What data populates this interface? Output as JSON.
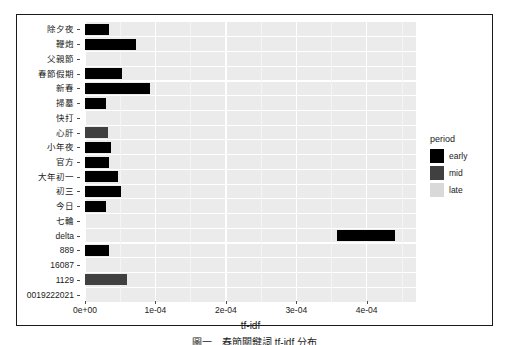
{
  "figure": {
    "caption": "圖一　春節關鍵詞 tf-idf 分布"
  },
  "axis": {
    "x_title": "tf-idf",
    "x_ticks": [
      "0e+00",
      "1e-04",
      "2e-04",
      "3e-04",
      "4e-04"
    ],
    "x_tick_values": [
      0,
      0.0001,
      0.0002,
      0.0003,
      0.0004
    ]
  },
  "legend": {
    "title": "period",
    "items": [
      {
        "label": "early",
        "color": "#000000"
      },
      {
        "label": "mid",
        "color": "#404040"
      },
      {
        "label": "late",
        "color": "#d9d9d9"
      }
    ]
  },
  "colors": {
    "panel_background": "#ebebeb",
    "gridline": "#ffffff",
    "early": "#000000",
    "mid": "#404040",
    "late": "#d9d9d9",
    "text": "#1a1a1a",
    "frame": "#1a1a1a"
  },
  "chart_data": {
    "type": "bar",
    "orientation": "horizontal",
    "title": "",
    "xlabel": "tf-idf",
    "ylabel": "",
    "xlim": [
      0,
      0.00047
    ],
    "grid": true,
    "legend_position": "right",
    "legend_title": "period",
    "categories": [
      "除夕夜",
      "鞭炮",
      "父親節",
      "春節假期",
      "新春",
      "掃墓",
      "快打",
      "心肝",
      "小年夜",
      "官方",
      "大年初一",
      "初三",
      "今日",
      "七輪",
      "delta",
      "889",
      "16087",
      "1129",
      "0019222021"
    ],
    "series": [
      {
        "name": "early",
        "color": "#000000",
        "values": [
          3.45e-05,
          7.3e-05,
          0,
          5.3e-05,
          9.3e-05,
          3e-05,
          0,
          0,
          3.75e-05,
          3.45e-05,
          4.75e-05,
          5.05e-05,
          3e-05,
          0,
          0,
          3.45e-05,
          0,
          0,
          0
        ]
      },
      {
        "name": "mid",
        "color": "#404040",
        "values": [
          0,
          0,
          0,
          0,
          0,
          0,
          0,
          3.3e-05,
          0,
          0,
          0,
          0,
          0,
          0,
          0,
          0,
          0,
          6e-05,
          0
        ]
      },
      {
        "name": "late",
        "color": "#d9d9d9",
        "values": [
          0,
          0,
          0,
          0,
          0,
          0,
          0,
          0,
          0,
          0,
          0,
          0,
          0,
          0,
          0,
          0,
          0,
          0,
          0
        ]
      }
    ],
    "floating_bars": [
      {
        "category": "delta",
        "series": "early",
        "x_start": 0.000358,
        "x_end": 0.00044,
        "color": "#000000"
      }
    ]
  }
}
